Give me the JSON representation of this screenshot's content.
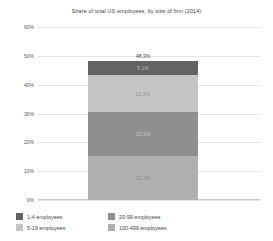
{
  "chart_data": {
    "type": "bar",
    "subtype": "stacked-bar-single-column",
    "title": "Share of total US employees, by size of firm (2014)",
    "xlabel": "",
    "ylabel": "",
    "ylim": [
      0,
      60
    ],
    "ytick_labels": [
      "60%",
      "50%",
      "40%",
      "30%",
      "20%",
      "10%",
      "0%"
    ],
    "ytick_values": [
      60,
      50,
      40,
      30,
      20,
      10,
      0
    ],
    "grid": true,
    "legend_position": "bottom",
    "categories": [
      "Total"
    ],
    "total_label": "48.3%",
    "total_value": 48.3,
    "series": [
      {
        "name": "1-4 employees",
        "label": "5.1%",
        "value": 5.1,
        "color": "#636363"
      },
      {
        "name": "5-19 employees",
        "label": "12.8%",
        "value": 12.8,
        "color": "#c4c4c4"
      },
      {
        "name": "20-99 employees",
        "label": "15.2%",
        "value": 15.2,
        "color": "#8f8f8f"
      },
      {
        "name": "100-499 employees",
        "label": "15.2%",
        "value": 15.2,
        "color": "#b0b0b0"
      }
    ]
  },
  "legend": {
    "items": [
      {
        "label": "1-4 employees",
        "color": "#636363"
      },
      {
        "label": "20-99 employees",
        "color": "#8f8f8f"
      },
      {
        "label": "5-19 employees",
        "color": "#c4c4c4"
      },
      {
        "label": "100-499 employees",
        "color": "#b0b0b0"
      }
    ]
  }
}
